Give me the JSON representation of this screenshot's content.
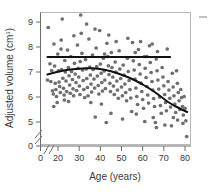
{
  "chart_data": {
    "type": "scatter",
    "title": "",
    "xlabel": "Age (years)",
    "ylabel_main": "Adjusted volume (cm",
    "ylabel_sup": "3",
    "ylabel_close": ")",
    "ylabel_full": "Adjusted volume (cm3)",
    "xlim": [
      13,
      82
    ],
    "ylim": [
      4.3,
      9.45
    ],
    "grid": false,
    "legend": null,
    "axis_break_x": true,
    "axis_break_y": true,
    "x_ticks": [
      "0",
      "20",
      "30",
      "40",
      "50",
      "60",
      "70",
      "80"
    ],
    "x_tick_values": [
      0,
      20,
      30,
      40,
      50,
      60,
      70,
      80
    ],
    "y_ticks": [
      "0",
      "5",
      "6",
      "7",
      "8",
      "9"
    ],
    "y_tick_values": [
      0,
      5,
      6,
      7,
      8,
      9
    ],
    "marker_color": "#6f6f6f",
    "line_color": "#111111",
    "frame_color": "#b9b9b9",
    "series": [
      {
        "name": "Adjusted volume by age",
        "type": "scatter",
        "points": [
          [
            15.0,
            6.68
          ],
          [
            15.4,
            8.78
          ],
          [
            16.2,
            7.33
          ],
          [
            16.6,
            6.62
          ],
          [
            17.0,
            7.06
          ],
          [
            17.4,
            6.25
          ],
          [
            17.8,
            6.12
          ],
          [
            18.1,
            8.12
          ],
          [
            18.4,
            7.24
          ],
          [
            18.7,
            6.55
          ],
          [
            19.0,
            6.3
          ],
          [
            19.3,
            6.02
          ],
          [
            19.6,
            5.78
          ],
          [
            19.9,
            7.72
          ],
          [
            20.2,
            7.05
          ],
          [
            20.5,
            6.6
          ],
          [
            20.8,
            6.42
          ],
          [
            21.1,
            6.18
          ],
          [
            21.4,
            7.92
          ],
          [
            21.7,
            7.1
          ],
          [
            22.0,
            9.12
          ],
          [
            22.3,
            6.75
          ],
          [
            22.6,
            6.35
          ],
          [
            22.9,
            6.08
          ],
          [
            23.2,
            7.46
          ],
          [
            23.5,
            7.0
          ],
          [
            23.8,
            6.64
          ],
          [
            24.1,
            6.22
          ],
          [
            24.5,
            7.88
          ],
          [
            24.9,
            7.18
          ],
          [
            25.2,
            6.85
          ],
          [
            25.5,
            6.48
          ],
          [
            25.8,
            6.15
          ],
          [
            26.1,
            7.62
          ],
          [
            26.4,
            7.02
          ],
          [
            26.8,
            6.7
          ],
          [
            27.1,
            6.33
          ],
          [
            27.4,
            6.05
          ],
          [
            27.8,
            7.35
          ],
          [
            28.1,
            6.92
          ],
          [
            28.5,
            6.58
          ],
          [
            28.8,
            6.26
          ],
          [
            29.2,
            8.08
          ],
          [
            29.5,
            7.15
          ],
          [
            29.8,
            6.8
          ],
          [
            30.1,
            6.44
          ],
          [
            30.4,
            6.1
          ],
          [
            30.7,
            9.28
          ],
          [
            31.0,
            8.55
          ],
          [
            31.3,
            7.75
          ],
          [
            31.6,
            7.08
          ],
          [
            31.9,
            6.66
          ],
          [
            32.2,
            6.3
          ],
          [
            32.6,
            5.98
          ],
          [
            33.0,
            7.5
          ],
          [
            33.3,
            7.12
          ],
          [
            33.6,
            6.74
          ],
          [
            33.9,
            6.38
          ],
          [
            34.2,
            6.05
          ],
          [
            34.6,
            8.32
          ],
          [
            35.0,
            7.2
          ],
          [
            35.3,
            6.88
          ],
          [
            35.6,
            6.52
          ],
          [
            35.9,
            6.2
          ],
          [
            36.3,
            7.68
          ],
          [
            36.6,
            7.1
          ],
          [
            37.0,
            6.72
          ],
          [
            37.3,
            6.36
          ],
          [
            37.6,
            5.2
          ],
          [
            38.0,
            7.96
          ],
          [
            38.3,
            7.22
          ],
          [
            38.6,
            6.84
          ],
          [
            39.0,
            6.46
          ],
          [
            39.3,
            6.12
          ],
          [
            39.7,
            8.66
          ],
          [
            40.0,
            7.32
          ],
          [
            40.4,
            6.95
          ],
          [
            40.7,
            6.58
          ],
          [
            41.0,
            6.24
          ],
          [
            41.4,
            7.55
          ],
          [
            41.8,
            7.04
          ],
          [
            42.1,
            6.68
          ],
          [
            42.4,
            6.34
          ],
          [
            42.8,
            4.98
          ],
          [
            43.1,
            8.15
          ],
          [
            43.5,
            7.62
          ],
          [
            43.8,
            7.25
          ],
          [
            44.1,
            6.9
          ],
          [
            44.5,
            6.55
          ],
          [
            44.8,
            6.22
          ],
          [
            45.2,
            7.78
          ],
          [
            45.5,
            7.18
          ],
          [
            45.9,
            6.8
          ],
          [
            46.2,
            6.44
          ],
          [
            46.6,
            6.1
          ],
          [
            47.0,
            7.4
          ],
          [
            47.4,
            7.0
          ],
          [
            47.8,
            6.64
          ],
          [
            48.1,
            6.28
          ],
          [
            48.5,
            5.95
          ],
          [
            48.9,
            7.85
          ],
          [
            49.2,
            7.12
          ],
          [
            49.6,
            6.74
          ],
          [
            50.0,
            6.4
          ],
          [
            50.4,
            6.05
          ],
          [
            50.8,
            7.28
          ],
          [
            51.2,
            6.88
          ],
          [
            51.6,
            6.52
          ],
          [
            52.0,
            6.18
          ],
          [
            52.4,
            5.85
          ],
          [
            52.8,
            7.55
          ],
          [
            53.2,
            7.02
          ],
          [
            53.6,
            6.66
          ],
          [
            54.0,
            6.3
          ],
          [
            54.4,
            5.96
          ],
          [
            54.8,
            5.42
          ],
          [
            55.2,
            8.18
          ],
          [
            55.6,
            7.45
          ],
          [
            56.0,
            7.08
          ],
          [
            56.4,
            6.72
          ],
          [
            56.8,
            6.36
          ],
          [
            57.2,
            6.02
          ],
          [
            57.6,
            5.7
          ],
          [
            58.0,
            7.9
          ],
          [
            58.4,
            7.3
          ],
          [
            58.8,
            6.92
          ],
          [
            59.2,
            6.56
          ],
          [
            59.6,
            6.22
          ],
          [
            60.0,
            5.9
          ],
          [
            60.4,
            5.55
          ],
          [
            60.8,
            7.62
          ],
          [
            61.2,
            7.15
          ],
          [
            61.6,
            6.78
          ],
          [
            62.0,
            6.42
          ],
          [
            62.4,
            6.08
          ],
          [
            62.8,
            5.76
          ],
          [
            63.2,
            8.05
          ],
          [
            63.6,
            7.38
          ],
          [
            64.0,
            6.98
          ],
          [
            64.4,
            6.62
          ],
          [
            64.8,
            6.28
          ],
          [
            65.2,
            5.94
          ],
          [
            65.6,
            5.62
          ],
          [
            66.0,
            4.98
          ],
          [
            66.4,
            7.52
          ],
          [
            66.8,
            7.05
          ],
          [
            67.2,
            6.68
          ],
          [
            67.6,
            6.32
          ],
          [
            68.0,
            6.0
          ],
          [
            68.4,
            5.66
          ],
          [
            68.8,
            5.35
          ],
          [
            69.2,
            7.18
          ],
          [
            69.6,
            6.8
          ],
          [
            70.0,
            6.45
          ],
          [
            70.4,
            6.1
          ],
          [
            70.8,
            5.78
          ],
          [
            71.2,
            5.45
          ],
          [
            71.6,
            7.92
          ],
          [
            72.0,
            6.62
          ],
          [
            72.4,
            6.28
          ],
          [
            72.8,
            5.95
          ],
          [
            73.2,
            5.6
          ],
          [
            73.6,
            4.85
          ],
          [
            74.0,
            6.95
          ],
          [
            74.4,
            6.4
          ],
          [
            74.8,
            6.05
          ],
          [
            75.2,
            5.72
          ],
          [
            75.6,
            5.38
          ],
          [
            76.0,
            7.05
          ],
          [
            76.4,
            6.55
          ],
          [
            76.8,
            6.18
          ],
          [
            77.2,
            5.85
          ],
          [
            77.6,
            5.5
          ],
          [
            78.0,
            6.3
          ],
          [
            78.4,
            5.98
          ],
          [
            78.8,
            5.62
          ],
          [
            79.2,
            5.28
          ],
          [
            79.6,
            6.02
          ],
          [
            80.0,
            5.55
          ],
          [
            80.4,
            5.05
          ],
          [
            80.8,
            4.42
          ],
          [
            33.5,
            8.92
          ],
          [
            27.5,
            8.45
          ],
          [
            21.5,
            8.28
          ],
          [
            44.0,
            8.48
          ],
          [
            47.5,
            8.22
          ],
          [
            53.0,
            8.35
          ],
          [
            59.0,
            8.22
          ],
          [
            64.5,
            8.12
          ],
          [
            37.5,
            8.72
          ],
          [
            30.5,
            7.42
          ],
          [
            42.0,
            7.72
          ],
          [
            56.5,
            7.78
          ],
          [
            62.0,
            7.62
          ],
          [
            67.0,
            7.82
          ],
          [
            25.0,
            5.82
          ],
          [
            35.5,
            5.78
          ],
          [
            40.5,
            5.72
          ],
          [
            45.0,
            5.35
          ],
          [
            50.5,
            5.12
          ],
          [
            61.0,
            5.02
          ],
          [
            65.0,
            5.18
          ],
          [
            70.5,
            4.88
          ],
          [
            76.5,
            5.08
          ],
          [
            79.0,
            4.95
          ],
          [
            18.0,
            5.62
          ],
          [
            23.0,
            5.88
          ],
          [
            57.0,
            5.32
          ],
          [
            66.5,
            4.78
          ],
          [
            74.5,
            5.18
          ]
        ]
      },
      {
        "name": "Flat reference fit",
        "type": "line",
        "style": "straight",
        "value": 7.6,
        "x_start": 15,
        "x_end": 73,
        "points": [
          [
            15,
            7.6
          ],
          [
            73,
            7.6
          ]
        ]
      },
      {
        "name": "Quadratic age trend fit",
        "type": "line",
        "style": "curve",
        "points": [
          [
            15,
            6.9
          ],
          [
            18,
            6.97
          ],
          [
            21,
            7.03
          ],
          [
            24,
            7.08
          ],
          [
            27,
            7.11
          ],
          [
            30,
            7.13
          ],
          [
            33,
            7.15
          ],
          [
            36,
            7.15
          ],
          [
            39,
            7.13
          ],
          [
            42,
            7.09
          ],
          [
            45,
            7.03
          ],
          [
            48,
            6.95
          ],
          [
            51,
            6.86
          ],
          [
            54,
            6.76
          ],
          [
            57,
            6.64
          ],
          [
            60,
            6.5
          ],
          [
            63,
            6.35
          ],
          [
            66,
            6.18
          ],
          [
            69,
            5.99
          ],
          [
            72,
            5.8
          ],
          [
            75,
            5.65
          ],
          [
            78,
            5.52
          ],
          [
            81,
            5.4
          ]
        ]
      }
    ],
    "annotations": [
      {
        "name": "right-edge-dash",
        "type": "tick-dash",
        "position": "outside-top-right"
      }
    ]
  }
}
